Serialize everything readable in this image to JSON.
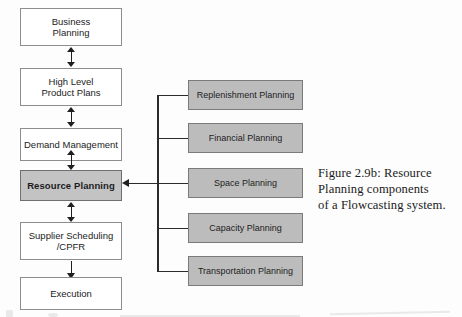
{
  "figure": {
    "caption_lines": [
      "Figure 2.9b: Resource",
      "Planning components",
      "of a Flowcasting system."
    ],
    "caption_full": "Figure 2.9b: Resource Planning components of a Flowcasting system."
  },
  "colors": {
    "highlight_fill": "#c3c3c3",
    "component_fill": "#bcbcbc",
    "box_stroke": "#8d8d8d",
    "connector": "#1f1f1f",
    "page_background": "#fdfdfd"
  },
  "process_chain": {
    "title": "Flowcasting planning hierarchy",
    "steps": [
      {
        "id": "business-planning",
        "line1": "Business",
        "line2": "Planning",
        "highlighted": false
      },
      {
        "id": "high-level-product-plans",
        "line1": "High Level",
        "line2": "Product Plans",
        "highlighted": false
      },
      {
        "id": "demand-management",
        "line1": "Demand Management",
        "line2": "",
        "highlighted": false
      },
      {
        "id": "resource-planning",
        "line1": "Resource Planning",
        "line2": "",
        "highlighted": true
      },
      {
        "id": "supplier-scheduling",
        "line1": "Supplier Scheduling",
        "line2": "/CPFR",
        "highlighted": false
      },
      {
        "id": "execution",
        "line1": "Execution",
        "line2": "",
        "highlighted": false
      }
    ],
    "connector_types": [
      "double-headed-vertical-arrow",
      "double-headed-vertical-arrow",
      "double-headed-vertical-arrow",
      "double-headed-vertical-arrow",
      "single-down-arrow"
    ]
  },
  "resource_components": {
    "title": "Resource Planning components",
    "feeds_into": "Resource Planning",
    "items": [
      {
        "id": "replenishment-planning",
        "label": "Replenishment Planning"
      },
      {
        "id": "financial-planning",
        "label": "Financial Planning"
      },
      {
        "id": "space-planning",
        "label": "Space Planning"
      },
      {
        "id": "capacity-planning",
        "label": "Capacity Planning"
      },
      {
        "id": "transportation-planning",
        "label": "Transportation Planning"
      }
    ]
  }
}
